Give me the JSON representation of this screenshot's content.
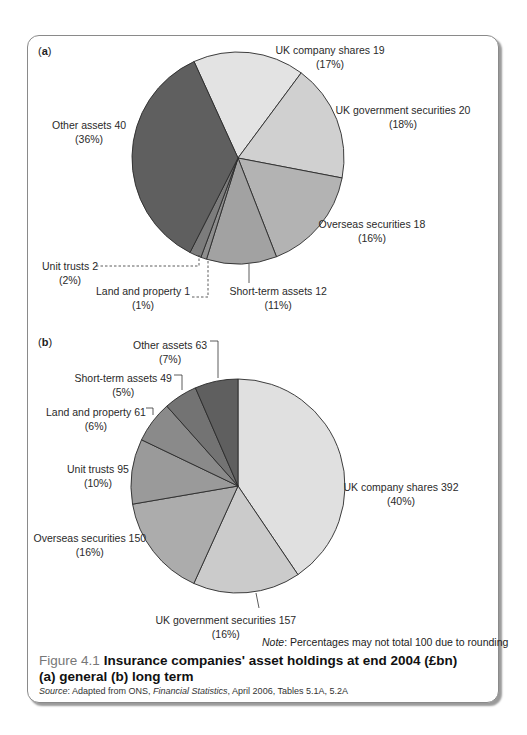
{
  "chart_data": [
    {
      "type": "pie",
      "panel": "(a)",
      "panel_letter": "a",
      "title": "general",
      "center": [
        238,
        158
      ],
      "radius": 106,
      "start_angle_deg": -24.5,
      "direction": "clockwise",
      "categories": [
        "UK company shares",
        "UK government securities",
        "Overseas securities",
        "Short-term assets",
        "Land and property",
        "Unit trusts",
        "Other assets"
      ],
      "values": [
        19,
        20,
        18,
        12,
        1,
        2,
        40
      ],
      "percentages": [
        17,
        18,
        16,
        11,
        1,
        2,
        36
      ],
      "colors": [
        "#e3e3e3",
        "#d0d0d0",
        "#b3b3b3",
        "#a2a2a2",
        "#8e8e8e",
        "#7c7c7c",
        "#5f5f5f"
      ],
      "labels": [
        {
          "text": "UK company shares 19",
          "pct": "(17%)",
          "x": 330,
          "y": 50
        },
        {
          "text": "UK government securities 20",
          "pct": "(18%)",
          "x": 403,
          "y": 110
        },
        {
          "text": "Overseas securities 18",
          "pct": "(16%)",
          "x": 372,
          "y": 224
        },
        {
          "text": "Short-term assets 12",
          "pct": "(11%)",
          "x": 278,
          "y": 291
        },
        {
          "text": "Land and property 1",
          "pct": "(1%)",
          "x": 143,
          "y": 291
        },
        {
          "text": "Unit trusts 2",
          "pct": "(2%)",
          "x": 70,
          "y": 266
        },
        {
          "text": "Other assets 40",
          "pct": "(36%)",
          "x": 89,
          "y": 125
        }
      ]
    },
    {
      "type": "pie",
      "panel": "(b)",
      "panel_letter": "b",
      "title": "long term",
      "center": [
        238,
        486
      ],
      "radius": 107,
      "start_angle_deg": 0,
      "direction": "clockwise",
      "categories": [
        "UK company shares",
        "UK government securities",
        "Overseas securities",
        "Unit trusts",
        "Land and property",
        "Short-term assets",
        "Other assets"
      ],
      "values": [
        392,
        157,
        150,
        95,
        61,
        49,
        63
      ],
      "percentages": [
        40,
        16,
        16,
        10,
        6,
        5,
        7
      ],
      "colors": [
        "#e0e0e0",
        "#cbcbcb",
        "#acacac",
        "#9a9a9a",
        "#8a8a8a",
        "#737373",
        "#5f5f5f"
      ],
      "labels": [
        {
          "text": "UK company shares 392",
          "pct": "(40%)",
          "x": 401,
          "y": 487
        },
        {
          "text": "UK government securities 157",
          "pct": "(16%)",
          "x": 226,
          "y": 620
        },
        {
          "text": "Overseas securities 150",
          "pct": "(16%)",
          "x": 90,
          "y": 538
        },
        {
          "text": "Unit trusts 95",
          "pct": "(10%)",
          "x": 98,
          "y": 469
        },
        {
          "text": "Land and property 61",
          "pct": "(6%)",
          "x": 96,
          "y": 412
        },
        {
          "text": "Short-term assets 49",
          "pct": "(5%)",
          "x": 123,
          "y": 378
        },
        {
          "text": "Other assets 63",
          "pct": "(7%)",
          "x": 170,
          "y": 345
        }
      ]
    }
  ],
  "note": {
    "label": "Note",
    "text": ": Percentages may not total 100 due to rounding"
  },
  "figure": {
    "number": "Figure 4.1",
    "title_line1": "Insurance companies' asset holdings at end 2004 (£bn)",
    "title_line2": "(a) general (b) long term"
  },
  "source": {
    "label": "Source",
    "text_pre": ": Adapted from ONS, ",
    "publication": "Financial Statistics",
    "text_post": ", April 2006, Tables 5.1A, 5.2A"
  },
  "panel_labels": {
    "a_open": "(",
    "a": "a",
    "a_close": ")",
    "b_open": "(",
    "b": "b",
    "b_close": ")"
  }
}
